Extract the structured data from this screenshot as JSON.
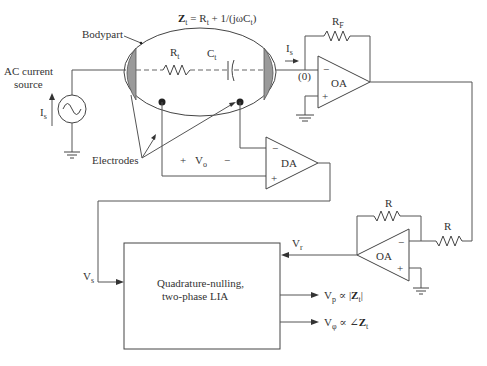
{
  "diagram": {
    "title_formula": {
      "z_symbol": "Z",
      "z_sub": "t",
      "equals": " = R",
      "r_sub": "t",
      "rest": " + 1/(jωC",
      "c_sub": "t",
      "close": ")"
    },
    "labels": {
      "bodypart": "Bodypart",
      "ac_source_line1": "AC current",
      "ac_source_line2": "source",
      "current_symbol": "I",
      "current_sub": "s",
      "electrodes": "Electrodes",
      "rt": "R",
      "rt_sub": "t",
      "ct": "C",
      "ct_sub": "t",
      "rf": "R",
      "rf_sub": "F",
      "virtual_ground": "(0)",
      "vo_plus": "+",
      "vo": "V",
      "vo_sub": "o",
      "vo_minus": "−",
      "r1": "R",
      "r2": "R",
      "vr": "V",
      "vr_sub": "r",
      "vs": "V",
      "vs_sub": "s"
    },
    "amplifiers": {
      "oa_top": {
        "label": "OA",
        "minus": "−",
        "plus": "+"
      },
      "da": {
        "label": "DA",
        "minus": "−",
        "plus": "+"
      },
      "oa_bottom": {
        "label": "OA",
        "minus": "−",
        "plus": "+"
      }
    },
    "lia_block": {
      "line1": "Quadrature-nulling,",
      "line2": "two-phase LIA"
    },
    "outputs": [
      {
        "v": "V",
        "sub": "p",
        "rel": " ∝ |",
        "z": "Z",
        "zsub": "t",
        "end": "|"
      },
      {
        "v": "V",
        "sub": "φ",
        "rel": " ∝ ∠",
        "z": "Z",
        "zsub": "t",
        "end": ""
      }
    ],
    "icons": {
      "ac_source": "sine-wave-source-icon",
      "ground": "ground-icon",
      "resistor": "resistor-zigzag-icon",
      "capacitor": "capacitor-icon",
      "opamp": "opamp-triangle-icon"
    }
  }
}
